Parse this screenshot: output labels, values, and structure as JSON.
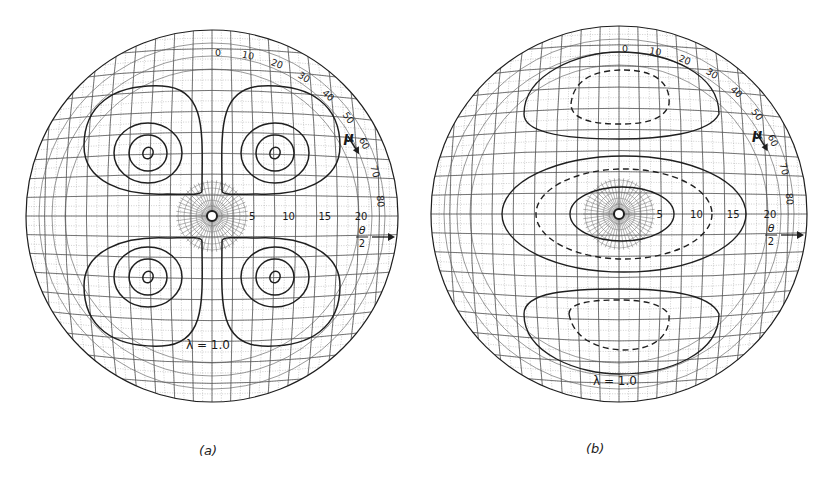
{
  "figure": {
    "panels": [
      {
        "id": "a",
        "caption": "(a)",
        "center": [
          212,
          216
        ],
        "radius": 186,
        "mu_axis_label": "μ",
        "mu_ticks": [
          "0",
          "10",
          "20",
          "30",
          "40",
          "50",
          "60",
          "70",
          "80"
        ],
        "theta_axis_label_num": "θ",
        "theta_axis_label_den": "2",
        "theta_ticks": [
          "5",
          "10",
          "15",
          "20"
        ],
        "lambda_label": "λ = 1.0",
        "contour_style": "four-lobe solid contours",
        "lobes": [
          {
            "cx": 148,
            "cy": 153
          },
          {
            "cx": 275,
            "cy": 153
          },
          {
            "cx": 148,
            "cy": 277
          },
          {
            "cx": 275,
            "cy": 277
          }
        ]
      },
      {
        "id": "b",
        "caption": "(b)",
        "center": [
          619,
          214
        ],
        "radius": 188,
        "mu_axis_label": "μ",
        "mu_ticks": [
          "0",
          "10",
          "20",
          "30",
          "40",
          "50",
          "60",
          "70",
          "80"
        ],
        "theta_axis_label_num": "θ",
        "theta_axis_label_den": "2",
        "theta_ticks": [
          "5",
          "10",
          "15",
          "20"
        ],
        "lambda_label": "λ = 1.0",
        "contour_style": "solid and dashed elliptical contours (central + top and bottom lobes)"
      }
    ]
  },
  "colors": {
    "ink": "#1f1f1f",
    "grid_major": "#555555",
    "grid_minor": "#9a9a9a",
    "background": "#ffffff"
  }
}
